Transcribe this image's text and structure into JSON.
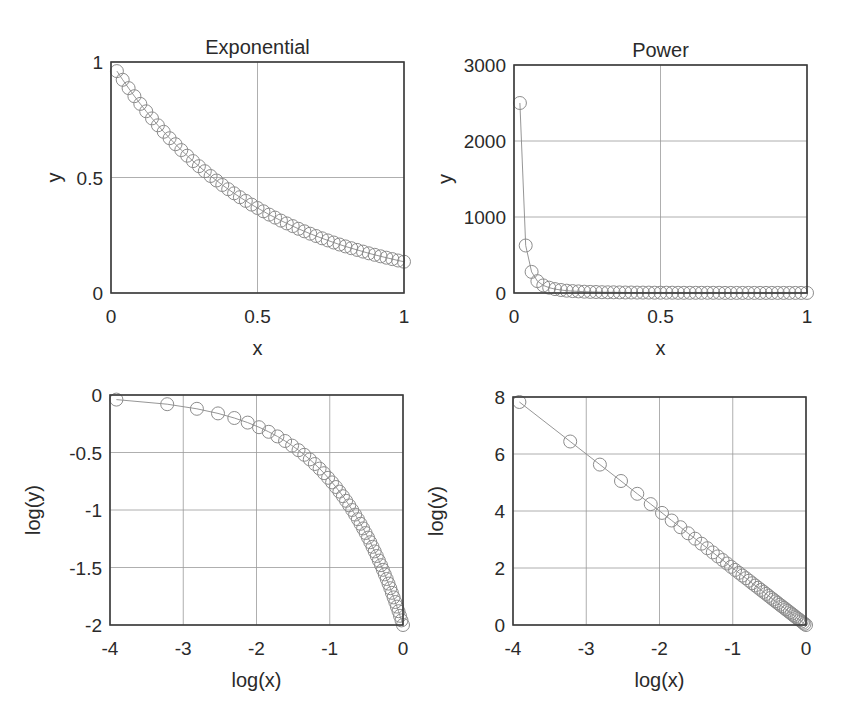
{
  "figure": {
    "width": 842,
    "height": 725,
    "colors": {
      "frame": "#3a3a3a",
      "grid": "#9a9a9a",
      "curve": "#8a8a8a",
      "marker": "#8c8c8c",
      "text": "#2a2a2a"
    }
  },
  "chart_data": [
    {
      "id": "exp-linear",
      "type": "line",
      "title": "Exponential",
      "xlabel": "x",
      "ylabel": "y",
      "xlim": [
        0,
        1
      ],
      "ylim": [
        0,
        1
      ],
      "xticks": [
        0,
        0.5,
        1
      ],
      "xtick_labels": [
        "0",
        "0.5",
        "1"
      ],
      "yticks": [
        0,
        0.5,
        1
      ],
      "ytick_labels": [
        "0",
        "0.5",
        "1"
      ],
      "grid": true,
      "marker": "open-circle",
      "box": [
        111,
        62,
        404,
        293
      ],
      "function": "y = exp(-2x)",
      "x": [
        0.02,
        0.04,
        0.06,
        0.08,
        0.1,
        0.12,
        0.14,
        0.16,
        0.18,
        0.2,
        0.22,
        0.24,
        0.26,
        0.28,
        0.3,
        0.32,
        0.34,
        0.36,
        0.38,
        0.4,
        0.42,
        0.44,
        0.46,
        0.48,
        0.5,
        0.52,
        0.54,
        0.56,
        0.58,
        0.6,
        0.62,
        0.64,
        0.66,
        0.68,
        0.7,
        0.72,
        0.74,
        0.76,
        0.78,
        0.8,
        0.82,
        0.84,
        0.86,
        0.88,
        0.9,
        0.92,
        0.94,
        0.96,
        0.98,
        1.0
      ],
      "y": [
        0.9608,
        0.9231,
        0.8869,
        0.8521,
        0.8187,
        0.7866,
        0.7558,
        0.7261,
        0.6977,
        0.6703,
        0.644,
        0.6188,
        0.5945,
        0.5712,
        0.5488,
        0.5273,
        0.5066,
        0.4868,
        0.4677,
        0.4493,
        0.4317,
        0.4148,
        0.3985,
        0.3829,
        0.3679,
        0.3535,
        0.3396,
        0.3263,
        0.3135,
        0.3012,
        0.2894,
        0.278,
        0.2671,
        0.2567,
        0.2466,
        0.2369,
        0.2276,
        0.2187,
        0.2101,
        0.2019,
        0.194,
        0.1864,
        0.1791,
        0.172,
        0.1653,
        0.1588,
        0.1526,
        0.1466,
        0.1409,
        0.1353
      ]
    },
    {
      "id": "power-linear",
      "type": "line",
      "title": "Power",
      "xlabel": "x",
      "ylabel": "y",
      "xlim": [
        0,
        1
      ],
      "ylim": [
        0,
        3000
      ],
      "xticks": [
        0,
        0.5,
        1
      ],
      "xtick_labels": [
        "0",
        "0.5",
        "1"
      ],
      "yticks": [
        0,
        1000,
        2000,
        3000
      ],
      "ytick_labels": [
        "0",
        "1000",
        "2000",
        "3000"
      ],
      "grid": true,
      "marker": "open-circle",
      "box": [
        514,
        65,
        807,
        293
      ],
      "function": "y = x^-2",
      "x": [
        0.02,
        0.04,
        0.06,
        0.08,
        0.1,
        0.12,
        0.14,
        0.16,
        0.18,
        0.2,
        0.22,
        0.24,
        0.26,
        0.28,
        0.3,
        0.32,
        0.34,
        0.36,
        0.38,
        0.4,
        0.42,
        0.44,
        0.46,
        0.48,
        0.5,
        0.52,
        0.54,
        0.56,
        0.58,
        0.6,
        0.62,
        0.64,
        0.66,
        0.68,
        0.7,
        0.72,
        0.74,
        0.76,
        0.78,
        0.8,
        0.82,
        0.84,
        0.86,
        0.88,
        0.9,
        0.92,
        0.94,
        0.96,
        0.98,
        1.0
      ],
      "y": [
        2500,
        625,
        277.8,
        156.25,
        100,
        69.44,
        51.02,
        39.06,
        30.86,
        25,
        20.66,
        17.36,
        14.79,
        12.76,
        11.11,
        9.77,
        8.65,
        7.72,
        6.93,
        6.25,
        5.67,
        5.17,
        4.73,
        4.34,
        4,
        3.7,
        3.43,
        3.19,
        2.97,
        2.78,
        2.6,
        2.44,
        2.3,
        2.16,
        2.04,
        1.93,
        1.83,
        1.73,
        1.64,
        1.56,
        1.49,
        1.42,
        1.35,
        1.29,
        1.23,
        1.18,
        1.13,
        1.09,
        1.04,
        1
      ]
    },
    {
      "id": "exp-log",
      "type": "line",
      "title": "",
      "xlabel": "log(x)",
      "ylabel": "log(y)",
      "xlim": [
        -4,
        0
      ],
      "ylim": [
        -2,
        0
      ],
      "xticks": [
        -4,
        -3,
        -2,
        -1,
        0
      ],
      "xtick_labels": [
        "-4",
        "-3",
        "-2",
        "-1",
        "0"
      ],
      "yticks": [
        -2,
        -1.5,
        -1,
        -0.5,
        0
      ],
      "ytick_labels": [
        "-2",
        "-1.5",
        "-1",
        "-0.5",
        "0"
      ],
      "grid": true,
      "marker": "open-circle",
      "box": [
        110,
        395,
        403,
        625
      ],
      "function": "log(y) = -2x vs log(x)",
      "x": [
        -3.912,
        -3.219,
        -2.813,
        -2.526,
        -2.303,
        -2.12,
        -1.966,
        -1.833,
        -1.715,
        -1.609,
        -1.514,
        -1.427,
        -1.347,
        -1.273,
        -1.204,
        -1.139,
        -1.079,
        -1.022,
        -0.968,
        -0.916,
        -0.868,
        -0.821,
        -0.777,
        -0.734,
        -0.693,
        -0.654,
        -0.616,
        -0.58,
        -0.545,
        -0.511,
        -0.478,
        -0.446,
        -0.416,
        -0.386,
        -0.357,
        -0.329,
        -0.301,
        -0.274,
        -0.248,
        -0.223,
        -0.198,
        -0.174,
        -0.151,
        -0.128,
        -0.105,
        -0.083,
        -0.062,
        -0.041,
        -0.02,
        0
      ],
      "y": [
        -0.04,
        -0.08,
        -0.12,
        -0.16,
        -0.2,
        -0.24,
        -0.28,
        -0.32,
        -0.36,
        -0.4,
        -0.44,
        -0.48,
        -0.52,
        -0.56,
        -0.6,
        -0.64,
        -0.68,
        -0.72,
        -0.76,
        -0.8,
        -0.84,
        -0.88,
        -0.92,
        -0.96,
        -1.0,
        -1.04,
        -1.08,
        -1.12,
        -1.16,
        -1.2,
        -1.24,
        -1.28,
        -1.32,
        -1.36,
        -1.4,
        -1.44,
        -1.48,
        -1.52,
        -1.56,
        -1.6,
        -1.64,
        -1.68,
        -1.72,
        -1.76,
        -1.8,
        -1.84,
        -1.88,
        -1.92,
        -1.96,
        -2.0
      ]
    },
    {
      "id": "power-log",
      "type": "line",
      "title": "",
      "xlabel": "log(x)",
      "ylabel": "log(y)",
      "xlim": [
        -4,
        0
      ],
      "ylim": [
        0,
        8
      ],
      "xticks": [
        -4,
        -3,
        -2,
        -1,
        0
      ],
      "xtick_labels": [
        "-4",
        "-3",
        "-2",
        "-1",
        "0"
      ],
      "yticks": [
        0,
        2,
        4,
        6,
        8
      ],
      "ytick_labels": [
        "0",
        "2",
        "4",
        "6",
        "8"
      ],
      "grid": true,
      "marker": "open-circle",
      "box": [
        513,
        397,
        806,
        625
      ],
      "function": "log(y) = -2 log(x)",
      "x": [
        -3.912,
        -3.219,
        -2.813,
        -2.526,
        -2.303,
        -2.12,
        -1.966,
        -1.833,
        -1.715,
        -1.609,
        -1.514,
        -1.427,
        -1.347,
        -1.273,
        -1.204,
        -1.139,
        -1.079,
        -1.022,
        -0.968,
        -0.916,
        -0.868,
        -0.821,
        -0.777,
        -0.734,
        -0.693,
        -0.654,
        -0.616,
        -0.58,
        -0.545,
        -0.511,
        -0.478,
        -0.446,
        -0.416,
        -0.386,
        -0.357,
        -0.329,
        -0.301,
        -0.274,
        -0.248,
        -0.223,
        -0.198,
        -0.174,
        -0.151,
        -0.128,
        -0.105,
        -0.083,
        -0.062,
        -0.041,
        -0.02,
        0
      ],
      "y": [
        7.824,
        6.438,
        5.627,
        5.051,
        4.605,
        4.241,
        3.932,
        3.665,
        3.43,
        3.219,
        3.028,
        2.854,
        2.694,
        2.546,
        2.408,
        2.279,
        2.158,
        2.043,
        1.935,
        1.833,
        1.735,
        1.642,
        1.553,
        1.468,
        1.386,
        1.308,
        1.232,
        1.16,
        1.09,
        1.022,
        0.956,
        0.892,
        0.831,
        0.771,
        0.713,
        0.657,
        0.602,
        0.549,
        0.497,
        0.446,
        0.397,
        0.349,
        0.302,
        0.256,
        0.211,
        0.167,
        0.124,
        0.082,
        0.04,
        0
      ]
    }
  ]
}
